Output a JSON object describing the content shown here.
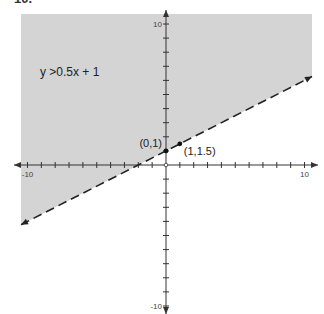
{
  "problem_number": "10.",
  "chart_data": {
    "type": "area",
    "title": "",
    "inequality": "y >0.5x + 1",
    "boundary_line": {
      "slope": 0.5,
      "intercept": 1,
      "style": "dashed"
    },
    "shaded_region": "above",
    "xlim": [
      -10,
      10
    ],
    "ylim": [
      -10,
      10
    ],
    "x_tick_labels": [
      "-10",
      "10"
    ],
    "y_tick_labels": [
      "10",
      "-10"
    ],
    "tick_step": 1,
    "points": [
      {
        "x": 0,
        "y": 1,
        "label": "(0,1)"
      },
      {
        "x": 1,
        "y": 1.5,
        "label": "(1,1.5)"
      }
    ],
    "colors": {
      "shade": "#d4d4d4",
      "line": "#222222",
      "axis": "#333333"
    },
    "grid": false
  }
}
